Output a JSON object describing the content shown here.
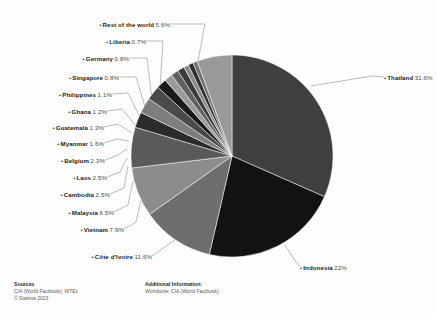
{
  "chart_data": {
    "type": "pie",
    "title": "",
    "subtitle": "",
    "legend_position": "callout-labels",
    "grid": false,
    "units": "percent",
    "categories": [
      "Thailand",
      "Indonesia",
      "Côte d'Ivoire",
      "Vietnam",
      "Malaysia",
      "Cambodia",
      "Laos",
      "Belgium",
      "Myanmar",
      "Guatemala",
      "Ghana",
      "Philippines",
      "Singapore",
      "Germany",
      "Liberia",
      "Rest of the world"
    ],
    "values": [
      31.6,
      22,
      11.6,
      7.9,
      6.5,
      2.5,
      2.5,
      2.3,
      1.6,
      1.3,
      1.2,
      1.1,
      0.8,
      0.8,
      0.7,
      5.6
    ],
    "value_labels": [
      "31.6%",
      "22%",
      "11.6%",
      "7.9%",
      "6.5%",
      "2.5%",
      "2.5%",
      "2.3%",
      "1.6%",
      "1.3%",
      "1.2%",
      "1.1%",
      "0.8%",
      "0.8%",
      "0.7%",
      "5.6%"
    ],
    "colors": [
      "#3f3f3f",
      "#121212",
      "#6e6e6e",
      "#8c8c8c",
      "#5a5a5a",
      "#2b2b2b",
      "#7d7d7d",
      "#4a4a4a",
      "#1a1a1a",
      "#9a9a9a",
      "#616161",
      "#3a3a3a",
      "#8a8a8a",
      "#2f2f2f",
      "#707070",
      "#999999"
    ]
  },
  "slices": [
    {
      "name": "Thailand",
      "value_label": "31.6%",
      "label_side": "right",
      "label_x": 384,
      "label_y": 75,
      "anchor_x": 311,
      "anchor_y": 86,
      "elbow_x": 372,
      "elbow_y": 76
    },
    {
      "name": "Indonesia",
      "value_label": "22%",
      "label_side": "right",
      "label_x": 300,
      "label_y": 265,
      "anchor_x": 285,
      "anchor_y": 245,
      "elbow_x": 296,
      "elbow_y": 262
    },
    {
      "name": "Côte d'Ivoire",
      "value_label": "11.6%",
      "label_side": "left",
      "label_x": 152,
      "label_y": 254,
      "anchor_x": 176,
      "anchor_y": 239,
      "elbow_x": 158,
      "elbow_y": 252
    },
    {
      "name": "Vietnam",
      "value_label": "7.9%",
      "label_side": "left",
      "label_x": 124,
      "label_y": 227,
      "anchor_x": 141,
      "anchor_y": 200,
      "elbow_x": 136,
      "elbow_y": 222
    },
    {
      "name": "Malaysia",
      "value_label": "6.5%",
      "label_side": "left",
      "label_x": 114,
      "label_y": 210,
      "anchor_x": 133,
      "anchor_y": 181,
      "elbow_x": 128,
      "elbow_y": 205
    },
    {
      "name": "Cambodia",
      "value_label": "2.5%",
      "label_side": "left",
      "label_x": 110,
      "label_y": 192,
      "anchor_x": 128,
      "anchor_y": 166,
      "elbow_x": 124,
      "elbow_y": 188
    },
    {
      "name": "Laos",
      "value_label": "2.5%",
      "label_side": "left",
      "label_x": 107,
      "label_y": 175,
      "anchor_x": 127,
      "anchor_y": 158,
      "elbow_x": 120,
      "elbow_y": 172
    },
    {
      "name": "Belgium",
      "value_label": "2.3%",
      "label_side": "left",
      "label_x": 105,
      "label_y": 158,
      "anchor_x": 127,
      "anchor_y": 149,
      "elbow_x": 118,
      "elbow_y": 155
    },
    {
      "name": "Myanmar",
      "value_label": "1.6%",
      "label_side": "left",
      "label_x": 104,
      "label_y": 141,
      "anchor_x": 129,
      "anchor_y": 141,
      "elbow_x": 117,
      "elbow_y": 139
    },
    {
      "name": "Guatemala",
      "value_label": "1.3%",
      "label_side": "left",
      "label_x": 104,
      "label_y": 125,
      "anchor_x": 132,
      "anchor_y": 133,
      "elbow_x": 118,
      "elbow_y": 124
    },
    {
      "name": "Ghana",
      "value_label": "1.2%",
      "label_side": "left",
      "label_x": 107,
      "label_y": 109,
      "anchor_x": 136,
      "anchor_y": 126,
      "elbow_x": 122,
      "elbow_y": 109
    },
    {
      "name": "Philippines",
      "value_label": "1.1%",
      "label_side": "left",
      "label_x": 112,
      "label_y": 92,
      "anchor_x": 141,
      "anchor_y": 119,
      "elbow_x": 128,
      "elbow_y": 93
    },
    {
      "name": "Singapore",
      "value_label": "0.8%",
      "label_side": "left",
      "label_x": 119,
      "label_y": 75,
      "anchor_x": 147,
      "anchor_y": 113,
      "elbow_x": 136,
      "elbow_y": 77
    },
    {
      "name": "Germany",
      "value_label": "0.8%",
      "label_side": "left",
      "label_x": 129,
      "label_y": 56,
      "anchor_x": 153,
      "anchor_y": 108,
      "elbow_x": 147,
      "elbow_y": 58
    },
    {
      "name": "Liberia",
      "value_label": "0.7%",
      "label_side": "left",
      "label_x": 146,
      "label_y": 39,
      "anchor_x": 159,
      "anchor_y": 103,
      "elbow_x": 163,
      "elbow_y": 41
    },
    {
      "name": "Rest of the world",
      "value_label": "5.6%",
      "label_side": "left",
      "label_x": 170,
      "label_y": 22,
      "anchor_x": 196,
      "anchor_y": 72,
      "elbow_x": 205,
      "elbow_y": 24
    }
  ],
  "footer": {
    "sources": {
      "title": "Sources",
      "lines": [
        "CIA (World Factbook); WTEx",
        "© Statista 2023"
      ]
    },
    "additional": {
      "title": "Additional Information:",
      "lines": [
        "Worldwide; CIA (World Factbook)"
      ]
    }
  }
}
